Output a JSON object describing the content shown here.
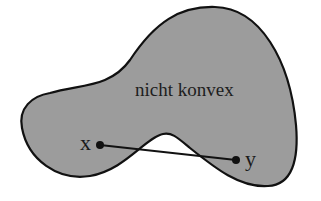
{
  "figure": {
    "shape": {
      "label": "nicht konvex",
      "fill_color": "#9c9c9c",
      "stroke_color": "#111111"
    },
    "points": [
      {
        "label": "x",
        "cx": 100,
        "cy": 145
      },
      {
        "label": "y",
        "cx": 236,
        "cy": 160
      }
    ],
    "segment": {
      "from": "x",
      "to": "y",
      "color": "#111111"
    }
  }
}
